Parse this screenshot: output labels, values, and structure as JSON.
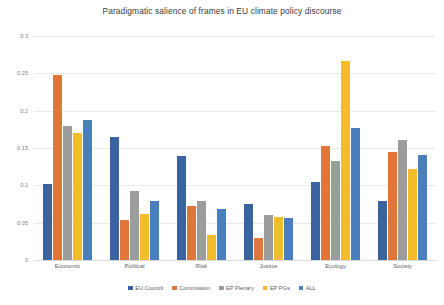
{
  "chart_data": {
    "type": "bar",
    "title": "Paradigmatic salience of frames in EU climate policy discourse",
    "xlabel": "",
    "ylabel": "",
    "ylim": [
      0,
      0.3
    ],
    "yticks": [
      "0",
      "0.05",
      "0.1",
      "0.15",
      "0.2",
      "0.25",
      "0.3"
    ],
    "ytick_values": [
      0,
      0.05,
      0.1,
      0.15,
      0.2,
      0.25,
      0.3
    ],
    "grid": true,
    "legend_position": "bottom",
    "categories": [
      "Economic",
      "Political",
      "Risk",
      "Justice",
      "Ecology",
      "Society"
    ],
    "series": [
      {
        "name": "EU Council",
        "color": "#3a64a0",
        "values": [
          0.102,
          0.165,
          0.139,
          0.075,
          0.105,
          0.079
        ]
      },
      {
        "name": "Commission",
        "color": "#e0763a",
        "values": [
          0.248,
          0.054,
          0.072,
          0.03,
          0.153,
          0.145
        ]
      },
      {
        "name": "EP Plenary",
        "color": "#9c9c9c",
        "values": [
          0.18,
          0.092,
          0.079,
          0.06,
          0.133,
          0.161
        ]
      },
      {
        "name": "EP PGs",
        "color": "#f2bc2c",
        "values": [
          0.17,
          0.061,
          0.033,
          0.058,
          0.267,
          0.122
        ]
      },
      {
        "name": "ALL",
        "color": "#4a7fbd",
        "values": [
          0.188,
          0.079,
          0.068,
          0.056,
          0.177,
          0.141
        ]
      }
    ]
  }
}
